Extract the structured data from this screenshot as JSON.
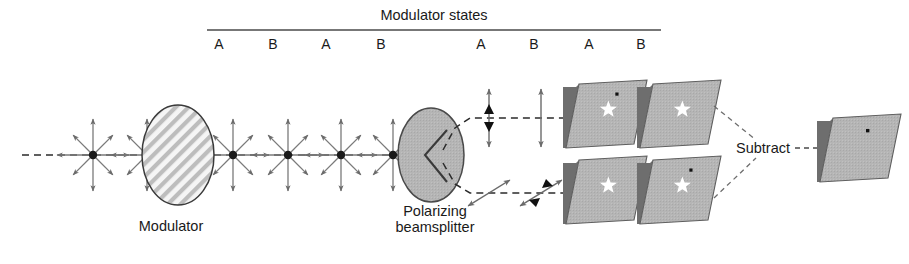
{
  "figure": {
    "width": 909,
    "height": 264,
    "background": "#ffffff"
  },
  "header": {
    "title": "Modulator states",
    "title_x": 434,
    "title_y": 8,
    "rule": {
      "x1": 207,
      "x2": 661,
      "y": 30
    }
  },
  "state_labels": [
    {
      "label": "A",
      "x": 219,
      "y": 38
    },
    {
      "label": "B",
      "x": 273,
      "y": 38
    },
    {
      "label": "A",
      "x": 326,
      "y": 38
    },
    {
      "label": "B",
      "x": 381,
      "y": 38
    },
    {
      "label": "A",
      "x": 481,
      "y": 38
    },
    {
      "label": "B",
      "x": 534,
      "y": 38
    },
    {
      "label": "A",
      "x": 589,
      "y": 38
    },
    {
      "label": "B",
      "x": 641,
      "y": 38
    }
  ],
  "components": {
    "modulator": {
      "label": "Modulator",
      "label_x": 171,
      "label_y": 218,
      "cx": 178,
      "cy": 155,
      "rx": 36,
      "ry": 50,
      "fill": "#f2f2f2",
      "stroke": "#333333",
      "hatch_color": "#b9b9b9"
    },
    "beamsplitter": {
      "label_line1": "Polarizing",
      "label_line2": "beamsplitter",
      "label_x": 435,
      "label_y": 210,
      "cx": 431,
      "cy": 155,
      "rx": 33,
      "ry": 47,
      "fill": "#b0b0b0",
      "stroke": "#4a4a4a",
      "notch_color": "#3a3a3a"
    },
    "subtract": {
      "label": "Subtract",
      "label_x": 790,
      "label_y": 148
    }
  },
  "optical_axis": {
    "y": 155,
    "x1": 22,
    "x2": 455,
    "color": "#2b2b2b"
  },
  "unpolarized_nodes": [
    {
      "cx": 93,
      "cy": 155,
      "r": 36
    },
    {
      "cx": 147,
      "cy": 155,
      "r": 36
    },
    {
      "cx": 233,
      "cy": 155,
      "r": 36
    },
    {
      "cx": 288,
      "cy": 155,
      "r": 36
    },
    {
      "cx": 341,
      "cy": 155,
      "r": 36
    },
    {
      "cx": 393,
      "cy": 155,
      "r": 36
    }
  ],
  "polarization_markers": [
    {
      "type": "vertical",
      "cx": 489,
      "cy": 118,
      "len": 58,
      "filled": true
    },
    {
      "type": "vertical",
      "cx": 541,
      "cy": 118,
      "len": 58,
      "filled": false
    },
    {
      "type": "diagonal",
      "cx": 489,
      "cy": 193,
      "len": 58,
      "filled": false
    },
    {
      "type": "diagonal",
      "cx": 541,
      "cy": 193,
      "len": 58,
      "filled": true
    }
  ],
  "beam_paths": {
    "upper_y": 118,
    "lower_y": 193,
    "split_x": 452,
    "detector_x": 566,
    "color": "#2b2b2b"
  },
  "detector_panels": [
    {
      "name": "panel-a-upper",
      "x": 566,
      "y": 84,
      "w": 68,
      "h": 64,
      "skew": 13,
      "fill": "#b5b5b5",
      "edge": "#6e6e6e",
      "star": {
        "dx": 0.52,
        "dy": 0.46,
        "size": 9
      },
      "dot": {
        "dx": 0.6,
        "dy": 0.22,
        "size": 3.2
      }
    },
    {
      "name": "panel-b-upper",
      "x": 640,
      "y": 84,
      "w": 68,
      "h": 64,
      "skew": 13,
      "fill": "#b5b5b5",
      "edge": "#6e6e6e",
      "star": {
        "dx": 0.52,
        "dy": 0.46,
        "size": 9
      },
      "dot": null
    },
    {
      "name": "panel-a-lower",
      "x": 566,
      "y": 160,
      "w": 68,
      "h": 64,
      "skew": 13,
      "fill": "#b5b5b5",
      "edge": "#6e6e6e",
      "star": {
        "dx": 0.52,
        "dy": 0.46,
        "size": 9
      },
      "dot": null
    },
    {
      "name": "panel-b-lower",
      "x": 640,
      "y": 160,
      "w": 68,
      "h": 64,
      "skew": 13,
      "fill": "#b5b5b5",
      "edge": "#6e6e6e",
      "star": {
        "dx": 0.52,
        "dy": 0.46,
        "size": 9
      },
      "dot": {
        "dx": 0.6,
        "dy": 0.22,
        "size": 3.2
      }
    }
  ],
  "result_panel": {
    "name": "panel-result",
    "x": 820,
    "y": 118,
    "w": 68,
    "h": 64,
    "skew": 13,
    "fill": "#b5b5b5",
    "edge": "#6e6e6e",
    "star": null,
    "dot": {
      "dx": 0.56,
      "dy": 0.26,
      "size": 3.4
    }
  },
  "colors": {
    "ink": "#1a1a1a",
    "arrow": "#666666",
    "arrow_dark": "#1a1a1a",
    "panel_gray": "#b5b5b5",
    "panel_edge": "#6e6e6e",
    "dashed": "#2b2b2b"
  }
}
